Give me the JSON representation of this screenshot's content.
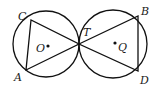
{
  "diagram": {
    "colors": {
      "stroke": "#111111",
      "text": "#1a1a1a",
      "background": "#ffffff"
    },
    "circles": [
      {
        "name": "O",
        "cx": 46,
        "cy": 44,
        "r": 33
      },
      {
        "name": "Q",
        "cx": 113,
        "cy": 44,
        "r": 34
      }
    ],
    "points": {
      "C": {
        "x": 31,
        "y": 15
      },
      "A": {
        "x": 26,
        "y": 70
      },
      "T": {
        "x": 79,
        "y": 44
      },
      "B": {
        "x": 139,
        "y": 16
      },
      "D": {
        "x": 139,
        "y": 71
      },
      "O": {
        "x": 48,
        "y": 46
      },
      "Q": {
        "x": 115,
        "y": 43
      }
    },
    "labels": {
      "C": "C",
      "A": "A",
      "T": "T",
      "B": "B",
      "D": "D",
      "O": "O",
      "Q": "Q"
    },
    "triangles": [
      [
        "C",
        "A",
        "T"
      ],
      [
        "T",
        "B",
        "D"
      ]
    ]
  }
}
